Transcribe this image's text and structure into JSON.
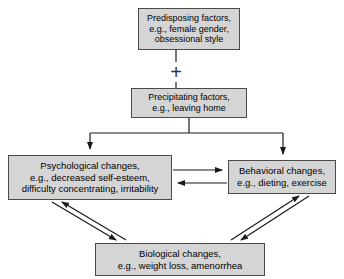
{
  "diagram": {
    "background_color": "#ffffff",
    "node_fill": "#d5d5d5",
    "node_border": "#4a4a4a",
    "line_color": "#1a1a1a",
    "nodes": [
      {
        "id": "predisposing",
        "label": "Predisposing factors,\ne.g., female gender,\nobsessional style"
      },
      {
        "id": "precipitating",
        "label": "Precipitating factors,\ne.g., leaving home"
      },
      {
        "id": "psychological",
        "label": "Psychological changes,\ne.g., decreased self-esteem,\ndifficulty concentrating, irritability"
      },
      {
        "id": "behavioral",
        "label": "Behavioral changes,\ne.g., dieting, exercise"
      },
      {
        "id": "biological",
        "label": "Biological changes,\ne.g., weight loss, amenorrhea"
      }
    ],
    "operators": [
      {
        "id": "plus",
        "symbol": "+"
      }
    ],
    "edges": [
      {
        "from": "predisposing",
        "to": "plus",
        "style": "line"
      },
      {
        "from": "plus",
        "to": "precipitating",
        "style": "line"
      },
      {
        "from": "precipitating",
        "to": "psychological",
        "style": "arrow"
      },
      {
        "from": "precipitating",
        "to": "behavioral",
        "style": "arrow"
      },
      {
        "from": "psychological",
        "to": "behavioral",
        "style": "arrow"
      },
      {
        "from": "behavioral",
        "to": "psychological",
        "style": "arrow"
      },
      {
        "from": "psychological",
        "to": "biological",
        "style": "arrow"
      },
      {
        "from": "biological",
        "to": "psychological",
        "style": "arrow"
      },
      {
        "from": "behavioral",
        "to": "biological",
        "style": "arrow"
      },
      {
        "from": "biological",
        "to": "behavioral",
        "style": "arrow"
      }
    ]
  }
}
